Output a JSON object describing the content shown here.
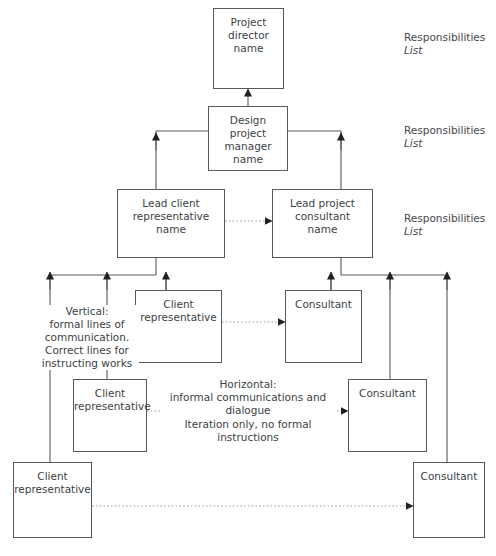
{
  "diagram": {
    "colors": {
      "line": "#555a5e",
      "box_border": "#555a5e",
      "text": "#3a3f44",
      "dotted": "#9aa0a4",
      "background": "#ffffff"
    },
    "nodes": {
      "project_director": "Project\ndirector\nname",
      "design_project_manager": "Design\nproject\nmanager\nname",
      "lead_client_representative": "Lead client\nrepresentative\nname",
      "lead_project_consultant": "Lead project\nconsultant\nname",
      "client_representative_mid": "Client\nrepresentative",
      "client_representative_lower": "Client\nrepresentative",
      "client_representative_bottom": "Client\nrepresentative",
      "consultant_mid": "Consultant",
      "consultant_lower": "Consultant",
      "consultant_bottom": "Consultant"
    },
    "side_labels": [
      {
        "title": "Responsibilities",
        "sub": "List"
      },
      {
        "title": "Responsibilities",
        "sub": "List"
      },
      {
        "title": "Responsibilities",
        "sub": "List"
      }
    ],
    "annotations": {
      "vertical": "Vertical:\nformal lines of\ncommunication.\nCorrect lines for\ninstructing works",
      "horizontal": "Horizontal:\ninformal communications and\ndialogue",
      "horizontal_sub": "Iteration only, no formal instructions"
    }
  }
}
